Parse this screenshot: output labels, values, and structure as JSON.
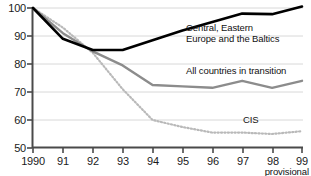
{
  "chart_data": {
    "type": "line",
    "title": "",
    "subtitle": "",
    "xlabel": "",
    "ylabel": "",
    "x": [
      1990,
      1991,
      1992,
      1993,
      1994,
      1995,
      1996,
      1997,
      1998,
      1999
    ],
    "xtick_labels": [
      "1990",
      "91",
      "92",
      "93",
      "94",
      "95",
      "96",
      "97",
      "98",
      "99"
    ],
    "ytick_labels": [
      "50",
      "60",
      "70",
      "80",
      "90",
      "100"
    ],
    "yticks": [
      50,
      60,
      70,
      80,
      90,
      100
    ],
    "ylim": [
      50,
      100
    ],
    "xlim": [
      1990,
      1999
    ],
    "grid": true,
    "legend_position": "inline-annotations",
    "annotations": [
      {
        "text": "provisional",
        "near_tick": "99",
        "position": "below-axis-right"
      }
    ],
    "series": [
      {
        "name": "Central, Eastern Europe and the Baltics",
        "label_line1": "Central, Eastern",
        "label_line2": "Europe and the Baltics",
        "style": "solid",
        "color": "#000000",
        "width": 2.6,
        "values": [
          100,
          89,
          85,
          85,
          88.5,
          92,
          95,
          98,
          97.8,
          100.5
        ]
      },
      {
        "name": "All countries in transition",
        "label_line1": "All countries in transition",
        "label_line2": "",
        "style": "solid",
        "color": "#8c8c8c",
        "width": 2.4,
        "values": [
          100,
          91,
          84.5,
          79.5,
          72.5,
          72,
          71.5,
          74,
          71.5,
          74
        ]
      },
      {
        "name": "CIS",
        "label_line1": "CIS",
        "label_line2": "",
        "style": "dotted",
        "color": "#b9b9b9",
        "width": 2.2,
        "values": [
          100,
          93,
          84,
          71,
          60,
          57.5,
          55.5,
          55.5,
          55,
          56
        ]
      }
    ]
  },
  "axis": {
    "y_labels": [
      "100",
      "90",
      "80",
      "70",
      "60",
      "50"
    ],
    "x_labels": [
      "1990",
      "91",
      "92",
      "93",
      "94",
      "95",
      "96",
      "97",
      "98",
      "99"
    ]
  },
  "labels": {
    "series1_line1": "Central, Eastern",
    "series1_line2": "Europe and the Baltics",
    "series2_line1": "All countries in transition",
    "series3_line1": "CIS",
    "provisional": "provisional"
  },
  "colors": {
    "series1": "#000000",
    "series2": "#8c8c8c",
    "series3": "#b9b9b9",
    "grid": "#d8d8d8",
    "axis": "#4a4a4a",
    "text": "#111111"
  }
}
